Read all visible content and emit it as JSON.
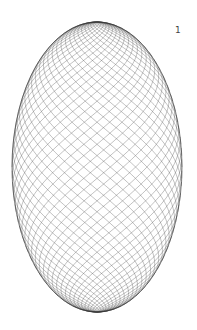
{
  "figure": {
    "label": "1",
    "shape": "ellipsoid-wireframe",
    "center": [
      97,
      167
    ],
    "rx": 85,
    "ry": 145,
    "helix_count": 40,
    "stroke_color": "#555555",
    "edge_color": "#222222"
  }
}
